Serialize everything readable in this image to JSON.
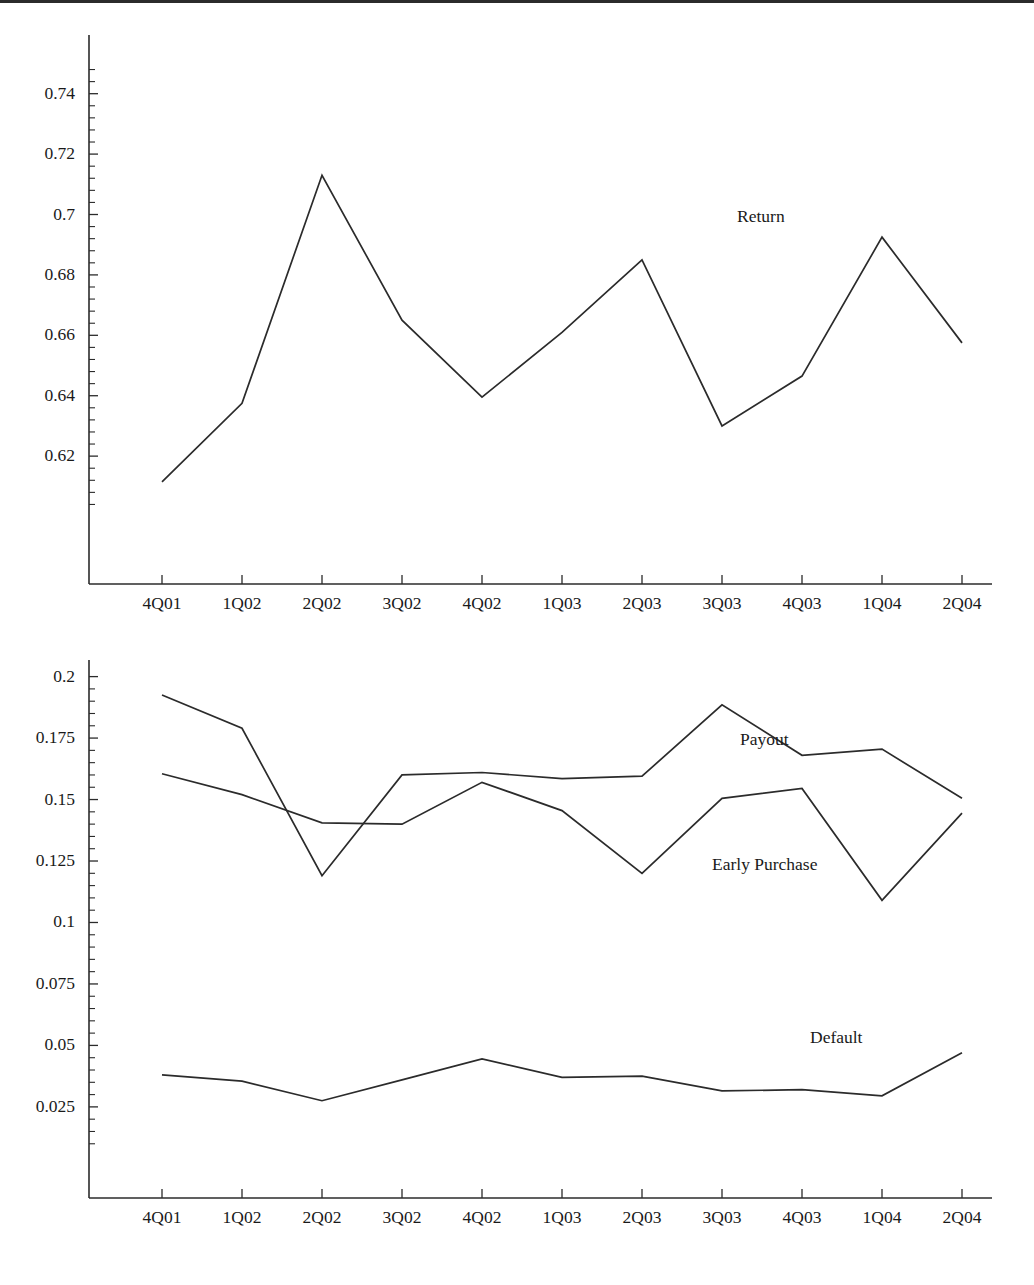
{
  "document": {
    "title": "Quarterly Return and Outcome Rates",
    "top_rule_visible": true
  },
  "chart_data": [
    {
      "id": "return-chart",
      "type": "line",
      "title": "",
      "xlabel": "",
      "ylabel": "",
      "grid": false,
      "legend_position": "inline-annotation",
      "categories": [
        "4Q01",
        "1Q02",
        "2Q02",
        "3Q02",
        "4Q02",
        "1Q03",
        "2Q03",
        "3Q03",
        "4Q03",
        "1Q04",
        "2Q04"
      ],
      "ylim": [
        0.6015,
        0.7495
      ],
      "ytick_labels": [
        "0.74",
        "0.72",
        "0.7",
        "0.68",
        "0.66",
        "0.64",
        "0.62"
      ],
      "ytick_values": [
        0.74,
        0.72,
        0.7,
        0.68,
        0.66,
        0.64,
        0.62
      ],
      "minor_ticks_per_interval": 4,
      "series": [
        {
          "name": "Return",
          "values": [
            0.6115,
            0.6375,
            0.713,
            0.665,
            0.6395,
            0.661,
            0.685,
            0.63,
            0.6465,
            0.6925,
            0.6575
          ],
          "annotation": {
            "text": "Return",
            "x_category": "1Q04",
            "y_value": 0.6995
          }
        }
      ]
    },
    {
      "id": "outcomes-chart",
      "type": "line",
      "title": "",
      "xlabel": "",
      "ylabel": "",
      "grid": false,
      "legend_position": "inline-annotation",
      "categories": [
        "4Q01",
        "1Q02",
        "2Q02",
        "3Q02",
        "4Q02",
        "1Q03",
        "2Q03",
        "3Q03",
        "4Q03",
        "1Q04",
        "2Q04"
      ],
      "ylim": [
        0.0095,
        0.2035
      ],
      "ytick_labels": [
        "0.2",
        "0.175",
        "0.15",
        "0.125",
        "0.1",
        "0.075",
        "0.05",
        "0.025"
      ],
      "ytick_values": [
        0.2,
        0.175,
        0.15,
        0.125,
        0.1,
        0.075,
        0.05,
        0.025
      ],
      "minor_ticks_per_interval": 4,
      "series": [
        {
          "name": "Payout",
          "values": [
            0.1925,
            0.179,
            0.119,
            0.16,
            0.161,
            0.1585,
            0.1595,
            0.1885,
            0.168,
            0.1705,
            0.1505
          ],
          "annotation": {
            "text": "Payout",
            "x_category": "3Q03",
            "y_value": 0.1745
          }
        },
        {
          "name": "Early Purchase",
          "values": [
            0.1605,
            0.152,
            0.1405,
            0.14,
            0.157,
            0.1455,
            0.12,
            0.1505,
            0.1545,
            0.109,
            0.1445
          ],
          "annotation": {
            "text": "Early Purchase",
            "x_category": "3Q03",
            "y_value": 0.1245
          }
        },
        {
          "name": "Default",
          "values": [
            0.038,
            0.0355,
            0.0275,
            0.036,
            0.0445,
            0.037,
            0.0375,
            0.0315,
            0.032,
            0.0295,
            0.047
          ],
          "annotation": {
            "text": "Default",
            "x_category": "1Q04",
            "y_value": 0.0535
          }
        }
      ]
    }
  ]
}
